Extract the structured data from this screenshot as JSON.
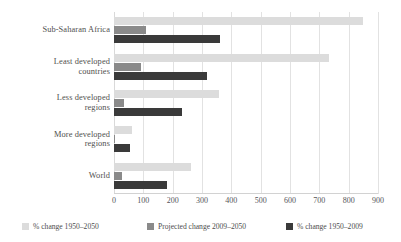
{
  "chart_data": {
    "type": "bar",
    "orientation": "horizontal",
    "title": "",
    "xlabel": "",
    "ylabel": "",
    "categories": [
      "Sub-Saharan Africa",
      "Least developed countries",
      "Less developed regions",
      "More developed regions",
      "World"
    ],
    "series": [
      {
        "name": "% change 1950–2050",
        "color": "#dcdcdc",
        "values": [
          850,
          733,
          358,
          62,
          262
        ]
      },
      {
        "name": "Projected change 2009–2050",
        "color": "#8a8a8a",
        "values": [
          108,
          92,
          34,
          2,
          28
        ]
      },
      {
        "name": "% change 1950–2009",
        "color": "#3a3a3a",
        "values": [
          360,
          317,
          232,
          55,
          180
        ]
      }
    ],
    "xlim": [
      0,
      900
    ],
    "xticks": [
      0,
      100,
      200,
      300,
      400,
      500,
      600,
      700,
      800,
      900
    ],
    "xtick_labels": [
      "0",
      "100",
      "200",
      "300",
      "400",
      "500",
      "600",
      "700",
      "800",
      "900"
    ],
    "grid": true,
    "legend_position": "bottom"
  },
  "category_labels": [
    {
      "lines": [
        "Sub-Saharan Africa"
      ]
    },
    {
      "lines": [
        "Least developed",
        "countries"
      ]
    },
    {
      "lines": [
        "Less developed",
        "regions"
      ]
    },
    {
      "lines": [
        "More developed",
        "regions"
      ]
    },
    {
      "lines": [
        "World"
      ]
    }
  ],
  "legend": {
    "items": [
      {
        "label": "% change 1950–2050",
        "color": "#dcdcdc"
      },
      {
        "label": "Projected change 2009–2050",
        "color": "#8a8a8a"
      },
      {
        "label": "% change 1950–2009",
        "color": "#3a3a3a"
      }
    ]
  },
  "colors": {
    "series_light": "#dcdcdc",
    "series_medium": "#8a8a8a",
    "series_dark": "#3a3a3a",
    "gridline": "#e2e2e2",
    "text": "#4d4d4d",
    "background": "#ffffff"
  }
}
